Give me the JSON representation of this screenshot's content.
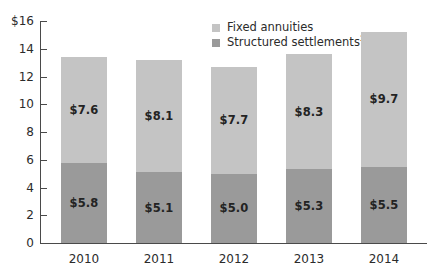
{
  "chart_data": {
    "type": "bar",
    "subtype": "stacked-vertical",
    "title": "",
    "xlabel": "",
    "ylabel": "",
    "categories": [
      "2010",
      "2011",
      "2012",
      "2013",
      "2014"
    ],
    "series": [
      {
        "name": "Structured settlements²",
        "legend_label": "Structured settlements",
        "legend_superscript": "2",
        "color": "#9a9a9a",
        "stack_position": "bottom",
        "values": [
          5.8,
          5.1,
          5.0,
          5.3,
          5.5
        ],
        "data_labels": [
          "$5.8",
          "$5.1",
          "$5.0",
          "$5.3",
          "$5.5"
        ]
      },
      {
        "name": "Fixed annuities",
        "legend_label": "Fixed annuities",
        "legend_superscript": "",
        "color": "#c4c4c4",
        "stack_position": "top",
        "values": [
          7.6,
          8.1,
          7.7,
          8.3,
          9.7
        ],
        "data_labels": [
          "$7.6",
          "$8.1",
          "$7.7",
          "$8.3",
          "$9.7"
        ]
      }
    ],
    "totals": [
      13.4,
      13.2,
      12.7,
      13.6,
      15.2
    ],
    "ylim": [
      0,
      16
    ],
    "ytick_values": [
      0,
      2,
      4,
      6,
      8,
      10,
      12,
      14,
      16
    ],
    "ytick_labels": [
      "0",
      "2",
      "4",
      "6",
      "8",
      "10",
      "12",
      "14",
      "$16"
    ],
    "grid": false,
    "legend_position": "top-right",
    "axis_color": "#4a4a4a",
    "background_color": "#ffffff"
  }
}
